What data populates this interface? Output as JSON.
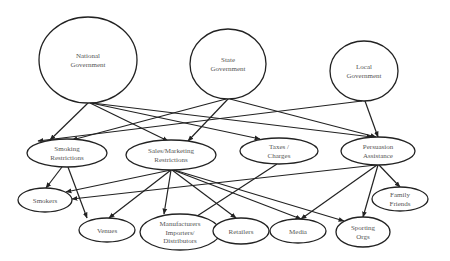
{
  "diagram": {
    "stroke_color": "#222222",
    "text_color": "#555555",
    "background": "#ffffff",
    "nodes": [
      {
        "id": "national",
        "lines": [
          "National",
          "Government"
        ],
        "cx": 88,
        "cy": 60,
        "rx": 49,
        "ry": 43
      },
      {
        "id": "state",
        "lines": [
          "State",
          "Government"
        ],
        "cx": 228,
        "cy": 64,
        "rx": 38,
        "ry": 35
      },
      {
        "id": "local",
        "lines": [
          "Local",
          "Government"
        ],
        "cx": 364,
        "cy": 71,
        "rx": 34,
        "ry": 30
      },
      {
        "id": "smoking",
        "lines": [
          "Smoking",
          "Restrictions"
        ],
        "cx": 67,
        "cy": 153,
        "rx": 40,
        "ry": 14
      },
      {
        "id": "sales",
        "lines": [
          "Sales/Marketing",
          "Restrictions"
        ],
        "cx": 171,
        "cy": 155,
        "rx": 45,
        "ry": 15
      },
      {
        "id": "taxes",
        "lines": [
          "Taxes /",
          "Charges"
        ],
        "cx": 279,
        "cy": 151,
        "rx": 39,
        "ry": 13
      },
      {
        "id": "persuasion",
        "lines": [
          "Persuasion",
          "Assistance"
        ],
        "cx": 378,
        "cy": 151,
        "rx": 37,
        "ry": 14
      },
      {
        "id": "smokers",
        "lines": [
          "Smokers"
        ],
        "cx": 45,
        "cy": 200,
        "rx": 27,
        "ry": 12
      },
      {
        "id": "venues",
        "lines": [
          "Venues"
        ],
        "cx": 107,
        "cy": 230,
        "rx": 28,
        "ry": 12
      },
      {
        "id": "manufacturers",
        "lines": [
          "Manufacturers",
          "Importers/",
          "Distributors"
        ],
        "cx": 180,
        "cy": 232,
        "rx": 40,
        "ry": 18
      },
      {
        "id": "retailers",
        "lines": [
          "Retailers"
        ],
        "cx": 241,
        "cy": 231,
        "rx": 28,
        "ry": 13
      },
      {
        "id": "media",
        "lines": [
          "Media"
        ],
        "cx": 298,
        "cy": 231,
        "rx": 28,
        "ry": 12
      },
      {
        "id": "sporting",
        "lines": [
          "Sporting",
          "Orgs"
        ],
        "cx": 363,
        "cy": 232,
        "rx": 27,
        "ry": 15
      },
      {
        "id": "family",
        "lines": [
          "Family",
          "Friends"
        ],
        "cx": 400,
        "cy": 199,
        "rx": 28,
        "ry": 12
      }
    ],
    "edges": [
      {
        "from": "national",
        "to": "smoking",
        "x1": 88,
        "y1": 103,
        "x2": 50,
        "y2": 140
      },
      {
        "from": "national",
        "to": "sales",
        "x1": 90,
        "y1": 103,
        "x2": 168,
        "y2": 141
      },
      {
        "from": "national",
        "to": "taxes",
        "x1": 91,
        "y1": 103,
        "x2": 260,
        "y2": 139
      },
      {
        "from": "national",
        "to": "persuasion",
        "x1": 92,
        "y1": 103,
        "x2": 372,
        "y2": 137
      },
      {
        "from": "state",
        "to": "smoking",
        "x1": 226,
        "y1": 99,
        "x2": 72,
        "y2": 140
      },
      {
        "from": "state",
        "to": "sales",
        "x1": 228,
        "y1": 99,
        "x2": 188,
        "y2": 141
      },
      {
        "from": "state",
        "to": "persuasion",
        "x1": 230,
        "y1": 99,
        "x2": 376,
        "y2": 137
      },
      {
        "from": "local",
        "to": "smoking",
        "x1": 362,
        "y1": 101,
        "x2": 38,
        "y2": 141
      },
      {
        "from": "local",
        "to": "persuasion",
        "x1": 365,
        "y1": 101,
        "x2": 378,
        "y2": 137
      },
      {
        "from": "smoking",
        "to": "smokers",
        "x1": 62,
        "y1": 167,
        "x2": 46,
        "y2": 188
      },
      {
        "from": "smoking",
        "to": "venues",
        "x1": 68,
        "y1": 167,
        "x2": 87,
        "y2": 218
      },
      {
        "from": "sales",
        "to": "smokers",
        "x1": 171,
        "y1": 170,
        "x2": 66,
        "y2": 192
      },
      {
        "from": "sales",
        "to": "venues",
        "x1": 171,
        "y1": 170,
        "x2": 109,
        "y2": 218
      },
      {
        "from": "sales",
        "to": "manufacturers",
        "x1": 171,
        "y1": 170,
        "x2": 164,
        "y2": 214
      },
      {
        "from": "sales",
        "to": "retailers",
        "x1": 172,
        "y1": 170,
        "x2": 236,
        "y2": 218
      },
      {
        "from": "sales",
        "to": "media",
        "x1": 173,
        "y1": 170,
        "x2": 301,
        "y2": 219
      },
      {
        "from": "sales",
        "to": "sporting",
        "x1": 174,
        "y1": 170,
        "x2": 344,
        "y2": 221
      },
      {
        "from": "taxes",
        "to": "manufacturers",
        "x1": 277,
        "y1": 164,
        "x2": 191,
        "y2": 220
      },
      {
        "from": "persuasion",
        "to": "smokers",
        "x1": 376,
        "y1": 165,
        "x2": 72,
        "y2": 199
      },
      {
        "from": "persuasion",
        "to": "media",
        "x1": 377,
        "y1": 165,
        "x2": 301,
        "y2": 219
      },
      {
        "from": "persuasion",
        "to": "sporting",
        "x1": 378,
        "y1": 165,
        "x2": 363,
        "y2": 217
      },
      {
        "from": "persuasion",
        "to": "family",
        "x1": 379,
        "y1": 165,
        "x2": 400,
        "y2": 187
      }
    ]
  }
}
